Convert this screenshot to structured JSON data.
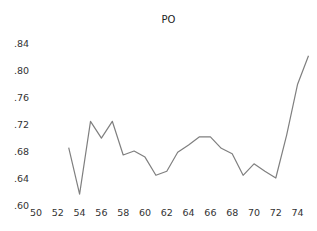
{
  "chart_data": {
    "type": "line",
    "title": "PO",
    "xlabel": "",
    "ylabel": "",
    "xlim": [
      50,
      75
    ],
    "ylim": [
      0.6,
      0.84
    ],
    "grid": false,
    "legend": null,
    "x_ticks": [
      "50",
      "52",
      "54",
      "56",
      "58",
      "60",
      "62",
      "64",
      "66",
      "68",
      "70",
      "72",
      "74"
    ],
    "y_ticks": [
      ".60",
      ".64",
      ".68",
      ".72",
      ".76",
      ".80",
      ".84"
    ],
    "x": [
      53,
      54,
      55,
      56,
      57,
      58,
      59,
      60,
      61,
      62,
      63,
      64,
      65,
      66,
      67,
      68,
      69,
      70,
      71,
      72,
      73,
      74,
      75
    ],
    "series": [
      {
        "name": "PO",
        "color": "#7f7f7f",
        "values": [
          0.685,
          0.616,
          0.724,
          0.699,
          0.724,
          0.674,
          0.68,
          0.671,
          0.644,
          0.65,
          0.678,
          0.689,
          0.701,
          0.701,
          0.684,
          0.676,
          0.644,
          0.661,
          0.65,
          0.64,
          0.704,
          0.779,
          0.821
        ]
      }
    ]
  }
}
